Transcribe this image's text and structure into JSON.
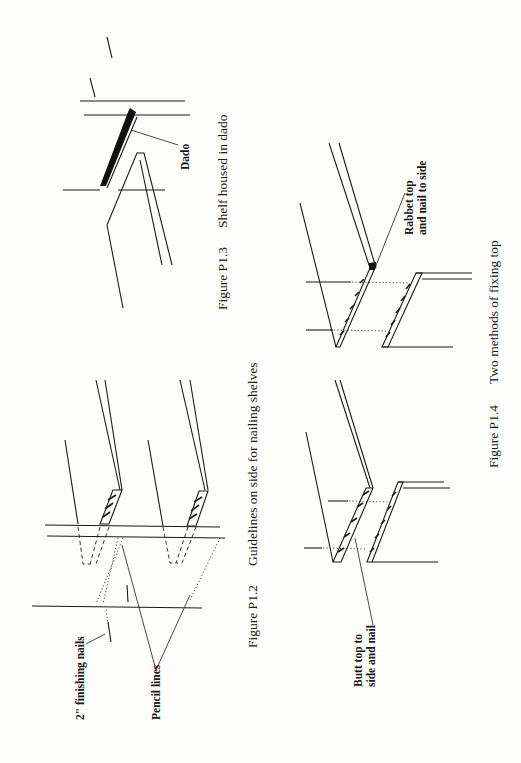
{
  "page": {
    "orientation": "rotated-90-ccw",
    "figures": [
      {
        "id": "P1.2",
        "caption_number": "Figure P1.2",
        "caption_text": "Guidelines on side for nailing shelves",
        "labels": [
          "2\" finishing nails",
          "Pencil lines"
        ]
      },
      {
        "id": "P1.3",
        "caption_number": "Figure P1.3",
        "caption_text": "Shelf housed in dado",
        "labels": [
          "Dado"
        ]
      },
      {
        "id": "P1.4",
        "caption_number": "Figure P1.4",
        "caption_text": "Two methods of fixing top",
        "labels": [
          "Butt top to",
          "side and nail",
          "Rabbet top",
          "and nail to side"
        ]
      }
    ]
  }
}
